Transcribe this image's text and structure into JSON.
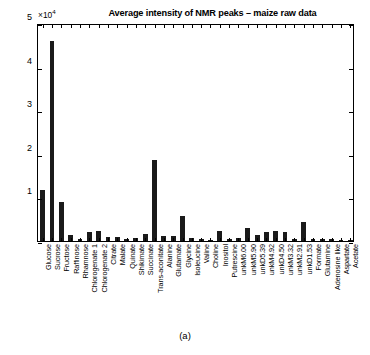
{
  "chart_data": {
    "type": "bar",
    "title": "Average intensity of NMR peaks – maize raw data",
    "caption": "(a)",
    "xlabel": "",
    "ylabel": "",
    "y_exponent_label": "×10",
    "y_exponent_power": "4",
    "y_scale_factor": 10000,
    "ylim": [
      0,
      50000
    ],
    "yticks": [
      0,
      1,
      2,
      3,
      4,
      5
    ],
    "ytick_labels": [
      "0",
      "1",
      "2",
      "3",
      "4",
      "5"
    ],
    "ytick_labels_shown": [
      "1",
      "2",
      "3",
      "4",
      "5"
    ],
    "grid": false,
    "legend": null,
    "bar_color": "#1a1a1a",
    "categories": [
      "Glucose",
      "Sucrose",
      "Fructose",
      "Raffinose",
      "Rhamnose",
      "Chlorogenate 1",
      "Chlorogenate 2",
      "Citrate",
      "Malate",
      "Quinate",
      "Shikimate",
      "Succinate",
      "Trans-aconitate",
      "Alanine",
      "Glutamate",
      "Glycine",
      "Isoleucine",
      "Valine",
      "Choline",
      "Inositol",
      "Putrescine",
      "unkM6.00",
      "unkM5.90",
      "unkD5.39",
      "unkM4.92",
      "unkD4.50",
      "unkM3.32",
      "unkM2.91",
      "unkD1.53",
      "Formate",
      "Glutamine",
      "Adenosine like",
      "Aspartate",
      "Acetate"
    ],
    "values": [
      11600,
      45900,
      9000,
      1300,
      400,
      2100,
      2400,
      900,
      1000,
      400,
      700,
      1500,
      18500,
      1200,
      1200,
      5700,
      800,
      500,
      300,
      2400,
      500,
      600,
      3000,
      1300,
      2000,
      2400,
      2000,
      400,
      4300,
      500,
      400,
      500,
      300,
      300
    ],
    "units": "intensity"
  }
}
